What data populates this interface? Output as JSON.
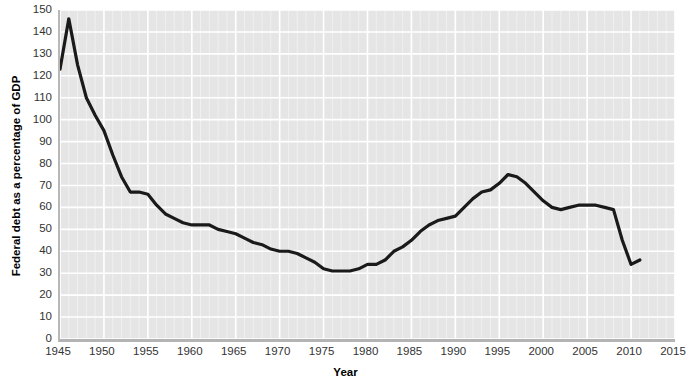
{
  "chart_data": {
    "type": "line",
    "title": "",
    "xlabel": "Year",
    "ylabel": "Federal debt as a percentage of GDP",
    "xlim": [
      1945,
      2015
    ],
    "ylim": [
      0,
      150
    ],
    "xticks": [
      1945,
      1950,
      1955,
      1960,
      1965,
      1970,
      1975,
      1980,
      1985,
      1990,
      1995,
      2000,
      2005,
      2010,
      2015
    ],
    "yticks": [
      0,
      10,
      20,
      30,
      40,
      50,
      60,
      70,
      80,
      90,
      100,
      110,
      120,
      130,
      140,
      150
    ],
    "grid": true,
    "grid_color": "#ffffff",
    "plot_background": "#e5e5e5",
    "line_color": "#1a1a1a",
    "line_width": 3.2,
    "legend": "none",
    "series": [
      {
        "name": "Federal debt as a percentage of GDP",
        "x": [
          1945,
          1946,
          1947,
          1948,
          1949,
          1950,
          1951,
          1952,
          1953,
          1954,
          1955,
          1956,
          1957,
          1958,
          1959,
          1960,
          1961,
          1962,
          1963,
          1964,
          1965,
          1966,
          1967,
          1968,
          1969,
          1970,
          1971,
          1972,
          1973,
          1974,
          1975,
          1976,
          1977,
          1978,
          1979,
          1980,
          1981,
          1982,
          1983,
          1984,
          1985,
          1986,
          1987,
          1988,
          1989,
          1990,
          1991,
          1992,
          1993,
          1994,
          1995,
          1996,
          1997,
          1998,
          1999,
          2000,
          2001,
          2002,
          2003,
          2004,
          2005,
          2006,
          2007,
          2008,
          2009,
          2010,
          2011
        ],
        "y": [
          123,
          146,
          125,
          110,
          102,
          95,
          84,
          74,
          67,
          67,
          66,
          61,
          57,
          55,
          53,
          52,
          52,
          52,
          50,
          49,
          48,
          46,
          44,
          43,
          41,
          40,
          40,
          39,
          37,
          35,
          32,
          31,
          31,
          31,
          32,
          34,
          34,
          36,
          40,
          42,
          45,
          49,
          52,
          54,
          55,
          56,
          60,
          64,
          67,
          68,
          71,
          75,
          74,
          71,
          67,
          63,
          60,
          59,
          60,
          61,
          61,
          61,
          60,
          59,
          45,
          34,
          36
        ]
      }
    ],
    "annotations": []
  },
  "axis": {
    "y_title": "Federal debt as a percentage of GDP",
    "x_title": "Year",
    "y_labels": [
      "150",
      "140",
      "130",
      "120",
      "110",
      "100",
      "90",
      "80",
      "70",
      "60",
      "50",
      "40",
      "30",
      "20",
      "10",
      "0"
    ],
    "x_labels": [
      "1945",
      "1950",
      "1955",
      "1960",
      "1965",
      "1970",
      "1975",
      "1980",
      "1985",
      "1990",
      "1995",
      "2000",
      "2005",
      "2010",
      "2015"
    ]
  }
}
